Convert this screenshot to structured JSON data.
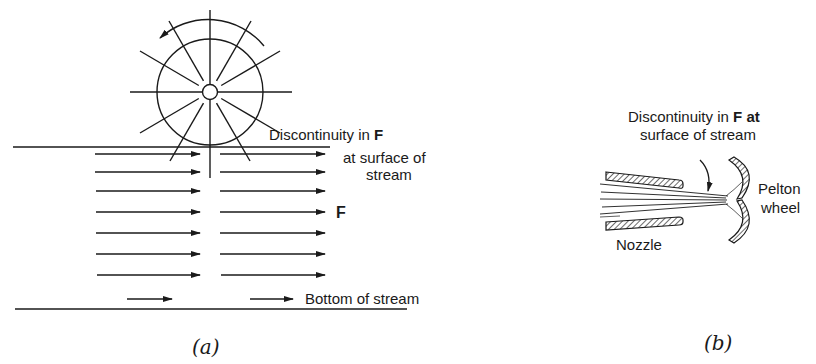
{
  "figure_a": {
    "caption": "(a)",
    "label_discontinuity_line1": "Discontinuity in",
    "label_discontinuity_F": "F",
    "label_discontinuity_line2": "at surface of",
    "label_discontinuity_line3": "stream",
    "label_field": "F",
    "label_bottom": "Bottom of stream",
    "arrow_rows": 7
  },
  "figure_b": {
    "caption": "(b)",
    "label_discontinuity_line1": "Discontinuity in",
    "label_discontinuity_F": "F",
    "label_discontinuity_at": "at",
    "label_discontinuity_line2": "surface of stream",
    "label_nozzle": "Nozzle",
    "label_pelton_line1": "Pelton",
    "label_pelton_line2": "wheel"
  },
  "colors": {
    "ink": "#1a1a1a",
    "background": "#ffffff"
  }
}
